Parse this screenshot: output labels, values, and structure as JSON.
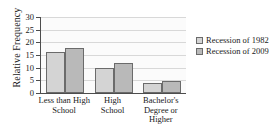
{
  "chart_data": {
    "type": "bar",
    "title": "",
    "xlabel": "",
    "ylabel": "Relative Frequency",
    "categories": [
      "Less than High School",
      "High School",
      "Bachelor's Degree or Higher"
    ],
    "category_lines": [
      [
        "Less than High",
        "School"
      ],
      [
        "High",
        "School"
      ],
      [
        "Bachelor's",
        "Degree or",
        "Higher"
      ]
    ],
    "series": [
      {
        "name": "Recession of 1982",
        "values": [
          16,
          10,
          3.8
        ],
        "color": "#d4d4d4"
      },
      {
        "name": "Recession of 2009",
        "values": [
          17.7,
          11.7,
          4.8
        ],
        "color": "#b9b9b9"
      }
    ],
    "ylim": [
      0,
      30
    ],
    "yticks": [
      0,
      5,
      10,
      15,
      20,
      25,
      30
    ],
    "ytick_labels": [
      "0",
      "5",
      "10",
      "15",
      "20",
      "25",
      "30"
    ],
    "grid": true,
    "grid_axis": "y",
    "legend_position": "right",
    "bar_border_color": "#6b6b6b",
    "axis_color": "#4d4d4d",
    "gridline_color": "#d8d8d8",
    "plot_background": "#fbfbfb"
  },
  "legend": {
    "entries": [
      {
        "label": "Recession of 1982"
      },
      {
        "label": "Recession of 2009"
      }
    ]
  }
}
